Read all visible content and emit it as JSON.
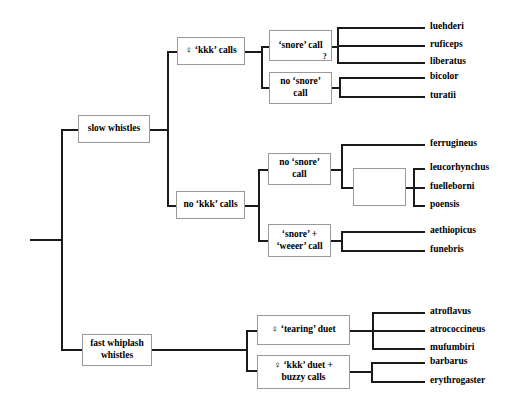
{
  "diagram": {
    "type": "cladogram",
    "title": "",
    "root": {
      "stem_label": ""
    },
    "nodes": {
      "slow_whistles": "slow whistles",
      "fast_whiplash": "fast whiplash\nwhistles",
      "kkk_calls": "♀ ‘kkk’ calls",
      "no_kkk_calls": "no ‘kkk’ calls",
      "snore_call": "‘snore’ call",
      "no_snore_call_top": "no ‘snore’\ncall",
      "no_snore_call_mid": "no ‘snore’\ncall",
      "snore_weeer_call": "‘snore’ +\n‘weeer’ call",
      "unlabeled_clade": "",
      "tearing_duet": "♀ ‘tearing’ duet",
      "kkk_duet_buzzy": "♀ ‘kkk’ duet +\nbuzzy calls"
    },
    "markers": {
      "uncertainty": "?"
    },
    "leaves": [
      {
        "id": "luehderi",
        "label": "luehderi",
        "parent": "snore_call"
      },
      {
        "id": "ruficeps",
        "label": "ruficeps",
        "parent": "snore_call"
      },
      {
        "id": "liberatus",
        "label": "liberatus",
        "parent": "snore_call"
      },
      {
        "id": "bicolor",
        "label": "bicolor",
        "parent": "no_snore_call_top"
      },
      {
        "id": "turatii",
        "label": "turatii",
        "parent": "no_snore_call_top"
      },
      {
        "id": "ferrugineus",
        "label": "ferrugineus",
        "parent": "no_snore_call_mid"
      },
      {
        "id": "leucorhynchus",
        "label": "leucorhynchus",
        "parent": "unlabeled_clade"
      },
      {
        "id": "fuelleborni",
        "label": "fuelleborni",
        "parent": "unlabeled_clade"
      },
      {
        "id": "poensis",
        "label": "poensis",
        "parent": "unlabeled_clade"
      },
      {
        "id": "aethiopicus",
        "label": "aethiopicus",
        "parent": "snore_weeer_call"
      },
      {
        "id": "funebris",
        "label": "funebris",
        "parent": "snore_weeer_call"
      },
      {
        "id": "atroflavus",
        "label": "atroflavus",
        "parent": "tearing_duet"
      },
      {
        "id": "atrococcineus",
        "label": "atrococcineus",
        "parent": "tearing_duet"
      },
      {
        "id": "mufumbiri",
        "label": "mufumbiri",
        "parent": "tearing_duet"
      },
      {
        "id": "barbarus",
        "label": "barbarus",
        "parent": "kkk_duet_buzzy"
      },
      {
        "id": "erythrogaster",
        "label": "erythrogaster",
        "parent": "kkk_duet_buzzy"
      }
    ],
    "colors": {
      "line": "#1a1a1a",
      "box_border": "#9a9a9a",
      "box_fill": "#ffffff",
      "text": "#000000",
      "background": "#ffffff"
    }
  }
}
